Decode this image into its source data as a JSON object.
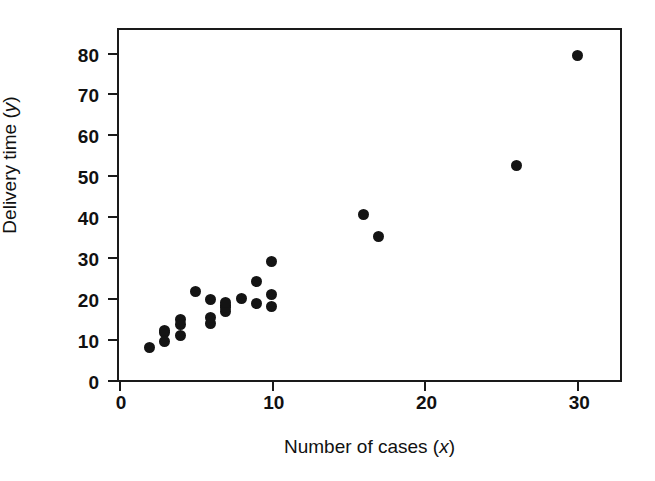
{
  "chart_data": {
    "type": "scatter",
    "title": "",
    "xlabel": "Number of cases (x)",
    "ylabel": "Delivery time (y)",
    "xlabel_text": "Number of cases (",
    "xlabel_var": "x",
    "xlabel_tail": ")",
    "ylabel_text": "Delivery time (",
    "ylabel_var": "y",
    "ylabel_tail": ")",
    "xlim": [
      0,
      32.8
    ],
    "ylim": [
      0,
      85.5
    ],
    "xticks": [
      0,
      10,
      20,
      30
    ],
    "xtick_labels": [
      "0",
      "10",
      "20",
      "30"
    ],
    "yticks": [
      0,
      10,
      20,
      30,
      40,
      50,
      60,
      70,
      80
    ],
    "ytick_labels": [
      "0",
      "10",
      "20",
      "30",
      "40",
      "50",
      "60",
      "70",
      "80"
    ],
    "grid": false,
    "legend": false,
    "marker_color": "#141414",
    "marker_shape": "circle",
    "frame_color": "#1a1a1a",
    "background": "#ffffff",
    "n_points": 25,
    "x": [
      7,
      3,
      3,
      4,
      6,
      7,
      2,
      7,
      30,
      5,
      16,
      10,
      4,
      6,
      9,
      10,
      6,
      7,
      3,
      17,
      10,
      26,
      9,
      8,
      4
    ],
    "y": [
      16.68,
      11.5,
      12.03,
      14.88,
      13.75,
      18.11,
      8.0,
      17.83,
      79.24,
      21.5,
      40.33,
      21.0,
      13.5,
      19.75,
      24.0,
      29.0,
      15.35,
      19.0,
      9.5,
      35.1,
      17.9,
      52.32,
      18.75,
      19.83,
      10.75
    ],
    "points": [
      {
        "x": 7,
        "y": 16.68
      },
      {
        "x": 3,
        "y": 11.5
      },
      {
        "x": 3,
        "y": 12.03
      },
      {
        "x": 4,
        "y": 14.88
      },
      {
        "x": 6,
        "y": 13.75
      },
      {
        "x": 7,
        "y": 18.11
      },
      {
        "x": 2,
        "y": 8.0
      },
      {
        "x": 7,
        "y": 17.83
      },
      {
        "x": 30,
        "y": 79.24
      },
      {
        "x": 5,
        "y": 21.5
      },
      {
        "x": 16,
        "y": 40.33
      },
      {
        "x": 10,
        "y": 21.0
      },
      {
        "x": 4,
        "y": 13.5
      },
      {
        "x": 6,
        "y": 19.75
      },
      {
        "x": 9,
        "y": 24.0
      },
      {
        "x": 10,
        "y": 29.0
      },
      {
        "x": 6,
        "y": 15.35
      },
      {
        "x": 7,
        "y": 19.0
      },
      {
        "x": 3,
        "y": 9.5
      },
      {
        "x": 17,
        "y": 35.1
      },
      {
        "x": 10,
        "y": 17.9
      },
      {
        "x": 26,
        "y": 52.32
      },
      {
        "x": 9,
        "y": 18.75
      },
      {
        "x": 8,
        "y": 19.83
      },
      {
        "x": 4,
        "y": 10.75
      }
    ]
  }
}
